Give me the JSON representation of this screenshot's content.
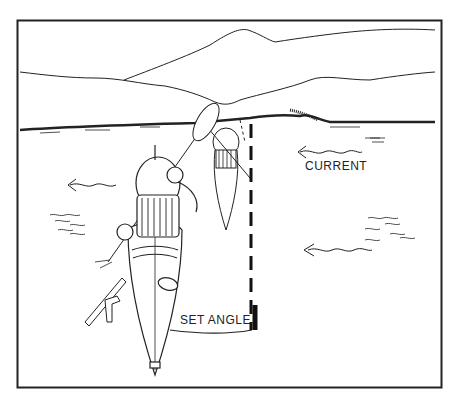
{
  "illustration": {
    "subject": "Kayak ferry across current",
    "labels": {
      "current": "CURRENT",
      "set_angle": "SET ANGLE"
    },
    "colors": {
      "ink": "#222222",
      "paper": "#ffffff"
    }
  }
}
